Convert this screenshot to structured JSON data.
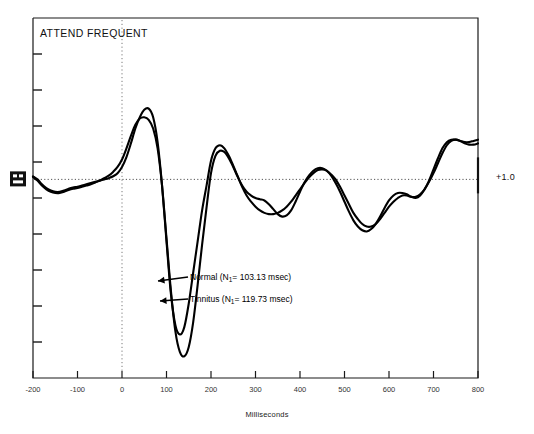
{
  "figure": {
    "title": "ATTEND FREQUENT",
    "amplitude_label": "+1.0",
    "marker_icon": "calibration-marker"
  },
  "chart_data": {
    "type": "line",
    "title": "ATTEND FREQUENT",
    "xlabel": "Milliseconds",
    "ylabel": "",
    "xlim": [
      -200,
      800
    ],
    "xticks": [
      -200,
      -100,
      0,
      100,
      200,
      300,
      400,
      500,
      600,
      700,
      800
    ],
    "xtick_labels": [
      "-200",
      "-100",
      "0",
      "100",
      "200",
      "300",
      "400",
      "500",
      "600",
      "700",
      "800"
    ],
    "ylim": [
      -3.2,
      2.6
    ],
    "yticks_unlabeled": 9,
    "grid": false,
    "zero_line_x": 0,
    "baseline_y": 0,
    "amplitude_scale_marker": "+1.0",
    "legend_position": "inline-annotations",
    "annotations": [
      {
        "name": "normal",
        "text": "Normal (N1= 103.13 msec)",
        "label_prefix": "Normal (N",
        "label_sub": "1",
        "label_suffix": "= 103.13 msec)",
        "n1_latency_msec": 103.13,
        "points_to_ms": 110
      },
      {
        "name": "tinnitus",
        "text": "Tinnitus (N1= 119.73 msec)",
        "label_prefix": "Tinnitus (N",
        "label_sub": "1",
        "label_suffix": "= 119.73 msec)",
        "n1_latency_msec": 119.73,
        "points_to_ms": 125
      }
    ],
    "series": [
      {
        "name": "Normal",
        "color": "#000000",
        "x": [
          -200,
          -190,
          -180,
          -170,
          -160,
          -150,
          -140,
          -130,
          -120,
          -110,
          -100,
          -90,
          -80,
          -70,
          -60,
          -50,
          -40,
          -30,
          -20,
          -10,
          0,
          10,
          20,
          30,
          40,
          50,
          60,
          70,
          80,
          90,
          100,
          110,
          120,
          130,
          140,
          150,
          160,
          170,
          180,
          190,
          200,
          210,
          220,
          230,
          240,
          250,
          260,
          270,
          280,
          290,
          300,
          310,
          320,
          330,
          340,
          350,
          360,
          370,
          380,
          390,
          400,
          410,
          420,
          430,
          440,
          450,
          460,
          470,
          480,
          490,
          500,
          510,
          520,
          530,
          540,
          550,
          560,
          570,
          580,
          590,
          600,
          610,
          620,
          630,
          640,
          650,
          660,
          670,
          680,
          690,
          700,
          710,
          720,
          730,
          740,
          750,
          760,
          770,
          780,
          790,
          800
        ],
        "y": [
          0.05,
          0.0,
          -0.08,
          -0.14,
          -0.18,
          -0.2,
          -0.2,
          -0.18,
          -0.15,
          -0.13,
          -0.12,
          -0.1,
          -0.08,
          -0.06,
          -0.04,
          -0.02,
          0.0,
          0.02,
          0.05,
          0.1,
          0.2,
          0.36,
          0.58,
          0.82,
          1.0,
          1.12,
          1.14,
          1.0,
          0.6,
          -0.1,
          -1.0,
          -1.85,
          -2.35,
          -2.5,
          -2.38,
          -2.0,
          -1.5,
          -1.0,
          -0.5,
          -0.1,
          0.3,
          0.5,
          0.55,
          0.5,
          0.38,
          0.22,
          0.05,
          -0.12,
          -0.26,
          -0.36,
          -0.44,
          -0.5,
          -0.54,
          -0.56,
          -0.56,
          -0.54,
          -0.5,
          -0.44,
          -0.36,
          -0.26,
          -0.16,
          -0.06,
          0.03,
          0.1,
          0.15,
          0.16,
          0.14,
          0.08,
          0.0,
          -0.12,
          -0.26,
          -0.4,
          -0.54,
          -0.64,
          -0.72,
          -0.76,
          -0.76,
          -0.72,
          -0.64,
          -0.54,
          -0.44,
          -0.36,
          -0.3,
          -0.26,
          -0.26,
          -0.28,
          -0.28,
          -0.24,
          -0.16,
          -0.04,
          0.1,
          0.26,
          0.42,
          0.55,
          0.62,
          0.64,
          0.62,
          0.58,
          0.56,
          0.56,
          0.58
        ]
      },
      {
        "name": "Tinnitus",
        "color": "#000000",
        "x": [
          -200,
          -190,
          -180,
          -170,
          -160,
          -150,
          -140,
          -130,
          -120,
          -110,
          -100,
          -90,
          -80,
          -70,
          -60,
          -50,
          -40,
          -30,
          -20,
          -10,
          0,
          10,
          20,
          30,
          40,
          50,
          60,
          70,
          80,
          90,
          100,
          110,
          120,
          130,
          140,
          150,
          160,
          170,
          180,
          190,
          200,
          210,
          220,
          230,
          240,
          250,
          260,
          270,
          280,
          290,
          300,
          310,
          320,
          330,
          340,
          350,
          360,
          370,
          380,
          390,
          400,
          410,
          420,
          430,
          440,
          450,
          460,
          470,
          480,
          490,
          500,
          510,
          520,
          530,
          540,
          550,
          560,
          570,
          580,
          590,
          600,
          610,
          620,
          630,
          640,
          650,
          660,
          670,
          680,
          690,
          700,
          710,
          720,
          730,
          740,
          750,
          760,
          770,
          780,
          790,
          800
        ],
        "y": [
          0.04,
          -0.02,
          -0.1,
          -0.16,
          -0.2,
          -0.22,
          -0.22,
          -0.2,
          -0.17,
          -0.15,
          -0.14,
          -0.12,
          -0.1,
          -0.08,
          -0.05,
          -0.02,
          0.02,
          0.06,
          0.12,
          0.2,
          0.32,
          0.5,
          0.7,
          0.88,
          0.98,
          1.0,
          0.96,
          0.82,
          0.5,
          -0.1,
          -0.95,
          -1.8,
          -2.45,
          -2.78,
          -2.85,
          -2.7,
          -2.3,
          -1.7,
          -1.05,
          -0.45,
          0.1,
          0.38,
          0.46,
          0.44,
          0.34,
          0.2,
          0.04,
          -0.1,
          -0.2,
          -0.26,
          -0.3,
          -0.32,
          -0.34,
          -0.4,
          -0.48,
          -0.56,
          -0.6,
          -0.58,
          -0.5,
          -0.36,
          -0.2,
          -0.05,
          0.06,
          0.14,
          0.18,
          0.18,
          0.14,
          0.06,
          -0.06,
          -0.2,
          -0.36,
          -0.52,
          -0.66,
          -0.76,
          -0.82,
          -0.84,
          -0.8,
          -0.72,
          -0.6,
          -0.46,
          -0.34,
          -0.26,
          -0.22,
          -0.22,
          -0.24,
          -0.28,
          -0.3,
          -0.26,
          -0.16,
          -0.02,
          0.16,
          0.34,
          0.5,
          0.6,
          0.64,
          0.64,
          0.62,
          0.6,
          0.6,
          0.62,
          0.64
        ]
      }
    ]
  }
}
